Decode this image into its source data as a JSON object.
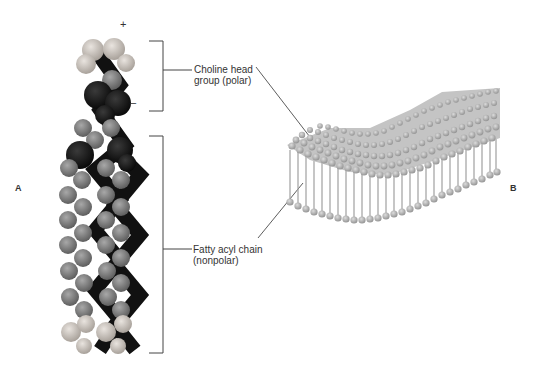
{
  "figure": {
    "panel_a": {
      "letter": "A",
      "signs": {
        "plus": "+",
        "minus": "–"
      },
      "labels": {
        "head_line1": "Choline head",
        "head_line2": "group (polar)",
        "tail_line1": "Fatty acyl chain",
        "tail_line2": "(nonpolar)"
      }
    },
    "panel_b": {
      "letter": "B"
    },
    "colors": {
      "dark_atom": "#1a1a1a",
      "light_atom": "#c9c2bb",
      "medium_atom": "#8a8a8a",
      "lipid_sphere": "#b5b5b5",
      "line": "#444444"
    }
  }
}
